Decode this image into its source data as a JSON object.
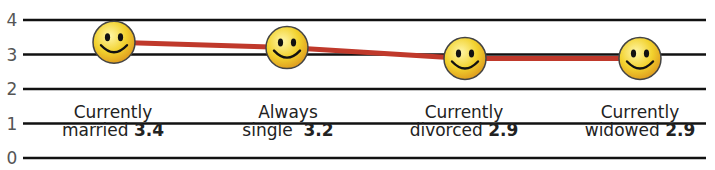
{
  "chart_data": {
    "type": "line",
    "title": "",
    "xlabel": "",
    "ylabel": "",
    "ylim": [
      0,
      4
    ],
    "yticks": [
      0,
      1,
      2,
      3,
      4
    ],
    "grid": true,
    "categories": [
      "Currently married",
      "Always single",
      "Currently divorced",
      "Currently widowed"
    ],
    "series": [
      {
        "name": "score",
        "values": [
          3.4,
          3.2,
          2.9,
          2.9
        ]
      }
    ],
    "markers": "smiley-face",
    "line_color": "#c0392b",
    "marker_color": "#f2d22e"
  },
  "labels": [
    {
      "line1": "Currently",
      "line2": "married",
      "value": "3.4"
    },
    {
      "line1": "Always",
      "line2": "single",
      "value": "3.2"
    },
    {
      "line1": "Currently",
      "line2": "divorced",
      "value": "2.9"
    },
    {
      "line1": "Currently",
      "line2": "widowed",
      "value": "2.9"
    }
  ],
  "yticks": [
    "0",
    "1",
    "2",
    "3",
    "4"
  ]
}
